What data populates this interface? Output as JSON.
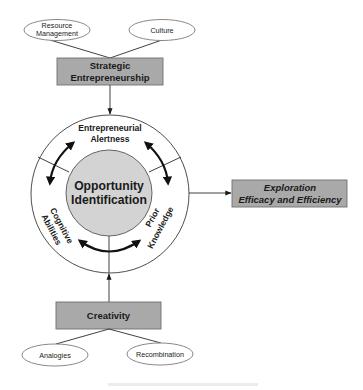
{
  "diagram": {
    "type": "conceptual-model",
    "colors": {
      "box_fill": "#a9a9a9",
      "box_stroke": "#6f6f6f",
      "core_fill": "#d3d3d3",
      "line": "#2b2b2b",
      "ellipse_stroke": "#7a7a7a",
      "arc": "#111111"
    },
    "top": {
      "inputs": [
        {
          "id": "resource-management",
          "lines": [
            "Resource",
            "Management"
          ]
        },
        {
          "id": "culture",
          "lines": [
            "Culture"
          ]
        }
      ],
      "box": {
        "lines": [
          "Strategic",
          "Entrepreneurship"
        ]
      }
    },
    "center": {
      "core": {
        "lines": [
          "Opportunity",
          "Identification"
        ]
      },
      "ring_segments": [
        {
          "id": "entrepreneurial-alertness",
          "lines": [
            "Entrepreneurial",
            "Alertness"
          ]
        },
        {
          "id": "cognitive-abilities",
          "lines": [
            "Cognitive",
            "Abilities"
          ]
        },
        {
          "id": "prior-knowledge",
          "lines": [
            "Prior",
            "Knowledge"
          ]
        }
      ]
    },
    "output": {
      "box": {
        "lines": [
          "Exploration",
          "Efficacy and Efficiency"
        ]
      }
    },
    "bottom": {
      "box": {
        "lines": [
          "Creativity"
        ]
      },
      "inputs": [
        {
          "id": "analogies",
          "lines": [
            "Analogies"
          ]
        },
        {
          "id": "recombination",
          "lines": [
            "Recombination"
          ]
        }
      ]
    },
    "edges": [
      {
        "from": "Resource Management",
        "to": "Strategic Entrepreneurship"
      },
      {
        "from": "Culture",
        "to": "Strategic Entrepreneurship"
      },
      {
        "from": "Strategic Entrepreneurship",
        "to": "Opportunity Identification",
        "arrow": true
      },
      {
        "from": "Creativity",
        "to": "Opportunity Identification",
        "arrow": true
      },
      {
        "from": "Analogies",
        "to": "Creativity"
      },
      {
        "from": "Recombination",
        "to": "Creativity"
      },
      {
        "from": "Opportunity Identification",
        "to": "Exploration Efficacy and Efficiency",
        "arrow": true
      }
    ]
  }
}
